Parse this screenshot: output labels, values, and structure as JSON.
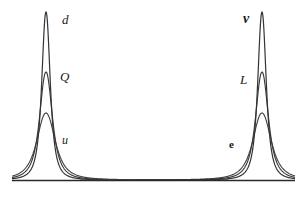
{
  "figure": {
    "background_color": "#ffffff",
    "curve_color": "#333333",
    "axis_color": "#2b2b2b",
    "width": 307,
    "height": 198,
    "baseline_y": 180,
    "baseline_x_start": 12,
    "baseline_x_end": 295
  },
  "labels": {
    "down": "d",
    "quark_doublet": "Q",
    "up": "u",
    "neutrino": "ν",
    "lepton_doublet": "L",
    "electron": "e"
  },
  "chart_data": {
    "type": "line",
    "title": "",
    "subtitle": "",
    "xlabel": "",
    "ylabel": "",
    "grid": false,
    "legend_position": "inline-annotations",
    "xlim": [
      0,
      307
    ],
    "ylim": [
      0,
      180
    ],
    "axes": {
      "x_axis_visible": true,
      "y_axis_visible": false,
      "x_ticks": [],
      "y_ticks": []
    },
    "clusters": [
      {
        "name": "quark-cluster",
        "center_x": 46,
        "series": [
          {
            "name": "d",
            "label": "d",
            "peak_x": 46,
            "peak_y": 12,
            "height": 168,
            "half_width": 6,
            "color": "#333333"
          },
          {
            "name": "Q",
            "label": "Q",
            "peak_x": 46,
            "peak_y": 72,
            "height": 108,
            "half_width": 9,
            "color": "#3a3a3a"
          },
          {
            "name": "u",
            "label": "u",
            "peak_x": 46,
            "peak_y": 113,
            "height": 67,
            "half_width": 13,
            "color": "#444444"
          }
        ]
      },
      {
        "name": "lepton-cluster",
        "center_x": 262,
        "series": [
          {
            "name": "nu",
            "label": "ν",
            "peak_x": 262,
            "peak_y": 12,
            "height": 168,
            "half_width": 6,
            "color": "#333333"
          },
          {
            "name": "L",
            "label": "L",
            "peak_x": 262,
            "peak_y": 72,
            "height": 108,
            "half_width": 9,
            "color": "#3a3a3a"
          },
          {
            "name": "e",
            "label": "e",
            "peak_x": 262,
            "peak_y": 113,
            "height": 67,
            "half_width": 13,
            "color": "#444444"
          }
        ]
      }
    ]
  }
}
